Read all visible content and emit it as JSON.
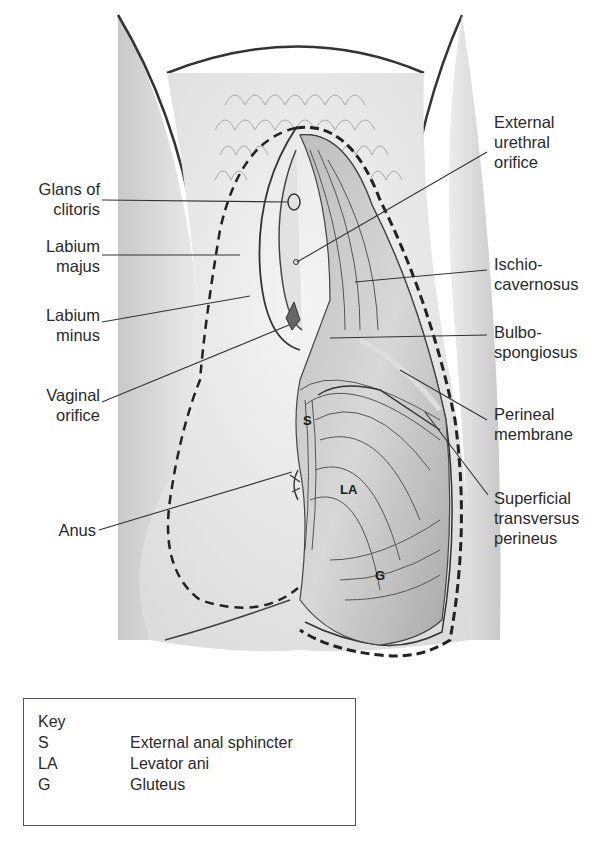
{
  "figure": {
    "left_labels": {
      "glans": [
        "Glans of",
        "clitoris"
      ],
      "majus": [
        "Labium",
        "majus"
      ],
      "minus": [
        "Labium",
        "minus"
      ],
      "vaginal": [
        "Vaginal",
        "orifice"
      ],
      "anus": [
        "Anus"
      ]
    },
    "right_labels": {
      "urethral": [
        "External",
        "urethral",
        "orifice"
      ],
      "ischio": [
        "Ischio-",
        "cavernosus"
      ],
      "bulbo": [
        "Bulbo-",
        "spongiosus"
      ],
      "perineal": [
        "Perineal",
        "membrane"
      ],
      "transversus": [
        "Superficial",
        "transversus",
        "perineus"
      ]
    },
    "inline_labels": {
      "s": "S",
      "la": "LA",
      "g": "G"
    }
  },
  "key": {
    "title": "Key",
    "rows": [
      {
        "abbr": "S",
        "meaning": "External anal sphincter"
      },
      {
        "abbr": "LA",
        "meaning": "Levator ani"
      },
      {
        "abbr": "G",
        "meaning": "Gluteus"
      }
    ]
  }
}
